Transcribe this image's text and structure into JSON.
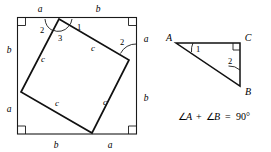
{
  "figure": {
    "colors": {
      "ink": "#111111",
      "outline": "#1a1a1a",
      "background": "#ffffff"
    },
    "square_figure": {
      "name": "outer-square-with-inscribed-square",
      "outer_square": {
        "corner_right_angle_marks": 4,
        "edge_labels": {
          "top_left": "a",
          "top_right": "b",
          "right_top": "a",
          "right_bottom": "b",
          "bottom_left": "b",
          "bottom_right": "a",
          "left_top": "b",
          "left_bottom": "a"
        }
      },
      "inner_square": {
        "side_labels": [
          "c",
          "c",
          "c",
          "c"
        ],
        "side_label_upper_left": "c",
        "side_label_upper_right": "c",
        "side_label_lower_right": "c",
        "side_label_lower_left": "c"
      },
      "angle_labels": {
        "top_left_of_vertex": "2",
        "top_center_of_vertex": "3",
        "top_right_of_vertex": "1",
        "right_side": "2"
      }
    },
    "triangle_figure": {
      "name": "right-triangle-ABC",
      "vertices": {
        "A": "A",
        "B": "B",
        "C": "C"
      },
      "angle_labels": {
        "at_A": "1",
        "at_B": "2"
      },
      "right_angle_at": "C",
      "equation": {
        "angle_symbol_1": "∠",
        "var_1": "A",
        "plus": "+",
        "angle_symbol_2": "∠",
        "var_2": "B",
        "equals": "=",
        "value": "90°",
        "full": "∠A + ∠B = 90°"
      }
    }
  }
}
